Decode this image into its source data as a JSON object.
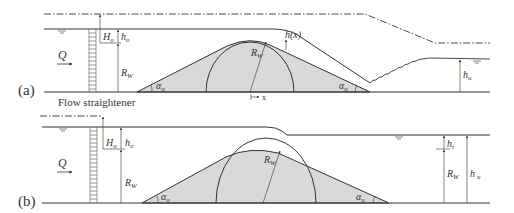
{
  "panels": [
    {
      "id": "a",
      "panel_label": "(a)",
      "labels": {
        "Q": "Q",
        "H_o": "H",
        "H_o_sub": "o",
        "h_o": "h",
        "h_o_sub": "o",
        "R_w_left": "R",
        "R_w_left_sub": "W",
        "R_w_crest": "R",
        "R_w_crest_sub": "W",
        "h_x": "h(x)",
        "alpha_o": "α",
        "alpha_o_sub": "o",
        "alpha_u": "α",
        "alpha_u_sub": "u",
        "x_axis": "x",
        "h_u": "h",
        "h_u_sub": "u"
      }
    },
    {
      "id": "b",
      "panel_label": "(b)",
      "labels": {
        "Q": "Q",
        "H_o": "H",
        "H_o_sub": "o",
        "h_o": "h",
        "h_o_sub": "o",
        "R_w_left": "R",
        "R_w_left_sub": "W",
        "R_w_crest": "R",
        "R_w_crest_sub": "W",
        "alpha_o": "α",
        "alpha_o_sub": "o",
        "alpha_u": "α",
        "alpha_u_sub": "u",
        "h_t": "h",
        "h_t_sub": "t",
        "R_w_right": "R",
        "R_w_right_sub": "W",
        "h_u": "h",
        "h_u_sub": "u"
      }
    }
  ],
  "caption": {
    "flow_straightener": "Flow straightener"
  },
  "colors": {
    "line": "#333333",
    "weir_fill": "#d9d9d9",
    "water_symbol": "#555555"
  }
}
